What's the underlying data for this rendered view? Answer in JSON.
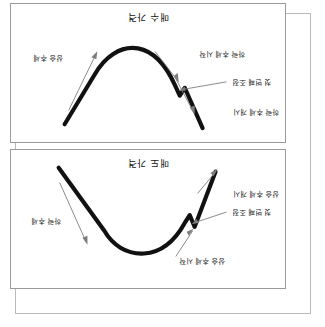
{
  "document": {
    "orientation_degrees": 180,
    "panel_count": 2
  },
  "colors": {
    "curve": "#111111",
    "leader_line": "#7d7d7d",
    "panel_border": "#9a9a9a",
    "outer_border": "#b9b9b9",
    "background": "#ffffff",
    "text": "#1b1b1b"
  },
  "panels": [
    {
      "id": "sell-price-panel",
      "title": "매도 가격",
      "shape": "peak",
      "annotations": [
        {
          "id": "uptrend-continue",
          "text": "상승 추세 시작"
        },
        {
          "id": "first-correction",
          "text": "첫 번째 조정"
        },
        {
          "id": "uptrend-start",
          "text": "상승 추세 개시"
        },
        {
          "id": "downtrend",
          "text": "하락 추세"
        }
      ]
    },
    {
      "id": "buy-price-panel",
      "title": "매수 가격",
      "shape": "trough",
      "annotations": [
        {
          "id": "downtrend-start-open",
          "text": "하락 추세 개시"
        },
        {
          "id": "first-correction",
          "text": "첫 번째 조정"
        },
        {
          "id": "downtrend-start",
          "text": "하락 추세 시작"
        },
        {
          "id": "uptrend",
          "text": "상승 추세"
        }
      ]
    }
  ]
}
